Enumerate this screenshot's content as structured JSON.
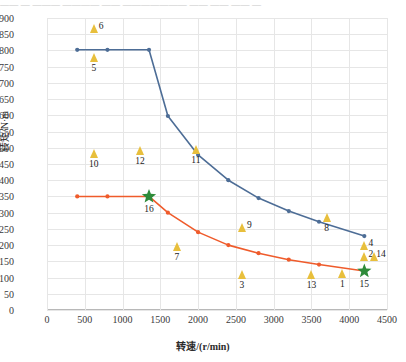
{
  "top_cut_text": "——  —   ———  ———— ——  ———————  —— ——  —— —",
  "chart_data": {
    "type": "line",
    "title": "",
    "xlabel": "转速/(r/min)",
    "ylabel": "转矩/N·m",
    "xlim": [
      0,
      4500
    ],
    "ylim": [
      0,
      900
    ],
    "xticks": [
      0,
      500,
      1000,
      1500,
      2000,
      2500,
      3000,
      3500,
      4000,
      4500
    ],
    "yticks": [
      0,
      50,
      100,
      150,
      200,
      250,
      300,
      350,
      400,
      450,
      500,
      550,
      600,
      650,
      700,
      750,
      800,
      850,
      900
    ],
    "grid": true,
    "legend": "none",
    "colors": {
      "series_blue": "#4d6d96",
      "series_orange": "#ef5b2b",
      "marker_triangle": "#e8bf3c",
      "marker_star": "#2e8b3a",
      "grid": "#e6e6e6",
      "axis": "#b8b8b8",
      "text": "#2b2b2b"
    },
    "series": [
      {
        "name": "series-blue",
        "color": "#4d6d96",
        "marker": "circle",
        "points": [
          {
            "x": 400,
            "y": 802
          },
          {
            "x": 800,
            "y": 802
          },
          {
            "x": 1350,
            "y": 802
          },
          {
            "x": 1600,
            "y": 598
          },
          {
            "x": 2000,
            "y": 478
          },
          {
            "x": 2400,
            "y": 400
          },
          {
            "x": 2800,
            "y": 345
          },
          {
            "x": 3200,
            "y": 305
          },
          {
            "x": 3600,
            "y": 272
          },
          {
            "x": 4200,
            "y": 228
          }
        ]
      },
      {
        "name": "series-orange",
        "color": "#ef5b2b",
        "marker": "circle",
        "points": [
          {
            "x": 400,
            "y": 350
          },
          {
            "x": 800,
            "y": 350
          },
          {
            "x": 1350,
            "y": 350
          },
          {
            "x": 1600,
            "y": 300
          },
          {
            "x": 2000,
            "y": 240
          },
          {
            "x": 2400,
            "y": 200
          },
          {
            "x": 2800,
            "y": 175
          },
          {
            "x": 3200,
            "y": 155
          },
          {
            "x": 3600,
            "y": 140
          },
          {
            "x": 4200,
            "y": 120
          }
        ]
      }
    ],
    "star_markers": [
      {
        "label": "16",
        "x": 1350,
        "y": 350,
        "label_pos": "below"
      },
      {
        "label": "15",
        "x": 4200,
        "y": 120,
        "label_pos": "below"
      }
    ],
    "triangle_markers": [
      {
        "label": "6",
        "x": 620,
        "y": 855,
        "label_pos": "right"
      },
      {
        "label": "5",
        "x": 620,
        "y": 765,
        "label_pos": "below"
      },
      {
        "label": "10",
        "x": 620,
        "y": 470,
        "label_pos": "below"
      },
      {
        "label": "12",
        "x": 1230,
        "y": 478,
        "label_pos": "below"
      },
      {
        "label": "11",
        "x": 1970,
        "y": 480,
        "label_pos": "below"
      },
      {
        "label": "9",
        "x": 2580,
        "y": 240,
        "label_pos": "right"
      },
      {
        "label": "7",
        "x": 1720,
        "y": 182,
        "label_pos": "below"
      },
      {
        "label": "8",
        "x": 3700,
        "y": 272,
        "label_pos": "below"
      },
      {
        "label": "3",
        "x": 2580,
        "y": 95,
        "label_pos": "below"
      },
      {
        "label": "13",
        "x": 3500,
        "y": 95,
        "label_pos": "below"
      },
      {
        "label": "1",
        "x": 3910,
        "y": 100,
        "label_pos": "below"
      },
      {
        "label": "4",
        "x": 4190,
        "y": 185,
        "label_pos": "right"
      },
      {
        "label": "2",
        "x": 4190,
        "y": 150,
        "label_pos": "right"
      },
      {
        "label": "14",
        "x": 4330,
        "y": 150,
        "label_pos": "right-far"
      }
    ]
  }
}
